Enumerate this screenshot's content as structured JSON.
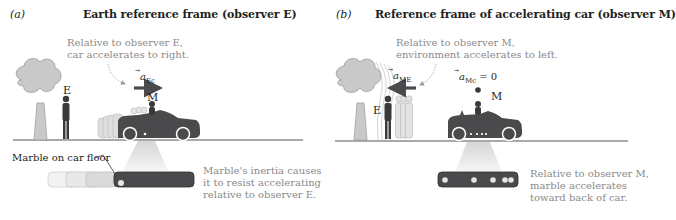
{
  "panel_a": {
    "label": "(a)",
    "title": "Earth reference frame (observer E)",
    "note_line1": "Relative to observer E,",
    "note_line2": "car accelerates to right.",
    "vector_symbol": "a",
    "vector_subscript": "Ec",
    "observer_E": "E",
    "observer_M": "M",
    "marble_callout": "Marble on car floor",
    "inertia_line1": "Marble's inertia causes",
    "inertia_line2": "it to resist accelerating",
    "inertia_line3": "relative to observer E."
  },
  "panel_b": {
    "label": "(b)",
    "title": "Reference frame of accelerating car (observer M)",
    "note_line1": "Relative to observer M,",
    "note_line2": "environment accelerates to left.",
    "vector_symbol": "a",
    "vector_subscript": "ME",
    "zero_vector_symbol": "a",
    "zero_vector_subscript": "Mc",
    "zero_vector_equals": "= 0",
    "observer_E": "E",
    "observer_M": "M",
    "marble_line1": "Relative to observer M,",
    "marble_line2": "marble accelerates",
    "marble_line3": "toward back of car."
  },
  "colors": {
    "dark_object": "#4a4a4c",
    "tree_fill": "#c9c9c9",
    "ghost_fill": "#d6d6d6",
    "ground": "#8c8c8c",
    "gray_text": "#8a8a8a",
    "floor_highlight": "#e6e6e6"
  }
}
